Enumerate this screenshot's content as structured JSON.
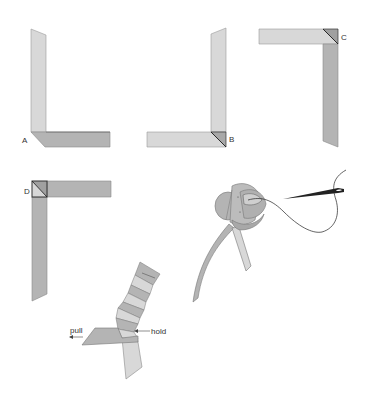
{
  "diagram": {
    "colors": {
      "light_ribbon": "#d8d8d8",
      "mid_ribbon": "#b4b4b4",
      "dark_fold": "#9a9a9a",
      "outline": "#8a8a8a",
      "edge_dark": "#333333",
      "thread": "#222222"
    },
    "steps": [
      {
        "id": "A",
        "label": "A"
      },
      {
        "id": "B",
        "label": "B"
      },
      {
        "id": "C",
        "label": "C"
      },
      {
        "id": "D",
        "label": "D"
      }
    ],
    "rolling_step": {
      "pull_label": "pull",
      "hold_label": "hold"
    },
    "finishing_step": {
      "elements": [
        "rose-head",
        "stem-ribbon",
        "tail-ribbon",
        "needle",
        "thread"
      ]
    }
  }
}
